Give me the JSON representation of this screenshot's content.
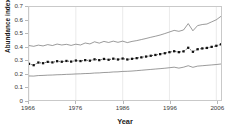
{
  "chart_data": {
    "type": "line",
    "title": "",
    "xlabel": "Year",
    "ylabel": "Abundance index",
    "xlim": [
      1966,
      2007
    ],
    "ylim": [
      0,
      0.7
    ],
    "grid": "vertical-light",
    "legend": "none",
    "xticks": [
      "1966",
      "1976",
      "1986",
      "1996",
      "2006"
    ],
    "xtick_values": [
      1966,
      1976,
      1986,
      1996,
      2006
    ],
    "yticks": [
      "0",
      "0.1",
      "0.2",
      "0.3",
      "0.4",
      "0.5",
      "0.6",
      "0.7"
    ],
    "ytick_values": [
      0,
      0.1,
      0.2,
      0.3,
      0.4,
      0.5,
      0.6,
      0.7
    ],
    "x": [
      1966,
      1967,
      1968,
      1969,
      1970,
      1971,
      1972,
      1973,
      1974,
      1975,
      1976,
      1977,
      1978,
      1979,
      1980,
      1981,
      1982,
      1983,
      1984,
      1985,
      1986,
      1987,
      1988,
      1989,
      1990,
      1991,
      1992,
      1993,
      1994,
      1995,
      1996,
      1997,
      1998,
      1999,
      2000,
      2001,
      2002,
      2003,
      2004,
      2005,
      2006,
      2007
    ],
    "series": [
      {
        "name": "upper confidence limit",
        "style": "solid-thin",
        "values": [
          0.41,
          0.404,
          0.413,
          0.407,
          0.417,
          0.41,
          0.421,
          0.414,
          0.419,
          0.411,
          0.42,
          0.414,
          0.429,
          0.422,
          0.438,
          0.428,
          0.441,
          0.433,
          0.443,
          0.434,
          0.443,
          0.432,
          0.441,
          0.447,
          0.455,
          0.463,
          0.472,
          0.48,
          0.489,
          0.5,
          0.512,
          0.524,
          0.517,
          0.527,
          0.575,
          0.521,
          0.56,
          0.568,
          0.572,
          0.588,
          0.604,
          0.63
        ]
      },
      {
        "name": "abundance index",
        "style": "dotted-markers",
        "values": [
          0.272,
          0.262,
          0.282,
          0.277,
          0.287,
          0.283,
          0.292,
          0.288,
          0.294,
          0.289,
          0.297,
          0.293,
          0.3,
          0.296,
          0.306,
          0.3,
          0.309,
          0.303,
          0.311,
          0.305,
          0.312,
          0.305,
          0.31,
          0.315,
          0.321,
          0.327,
          0.333,
          0.339,
          0.345,
          0.352,
          0.36,
          0.367,
          0.36,
          0.366,
          0.393,
          0.363,
          0.382,
          0.388,
          0.392,
          0.4,
          0.408,
          0.419
        ]
      },
      {
        "name": "lower confidence limit",
        "style": "solid-thin",
        "values": [
          0.181,
          0.18,
          0.184,
          0.185,
          0.187,
          0.188,
          0.19,
          0.191,
          0.193,
          0.194,
          0.196,
          0.197,
          0.199,
          0.2,
          0.203,
          0.204,
          0.207,
          0.208,
          0.211,
          0.212,
          0.215,
          0.216,
          0.218,
          0.221,
          0.224,
          0.227,
          0.23,
          0.233,
          0.236,
          0.239,
          0.243,
          0.247,
          0.24,
          0.247,
          0.258,
          0.246,
          0.255,
          0.258,
          0.261,
          0.264,
          0.267,
          0.271
        ]
      }
    ],
    "colors": {
      "line": "#555555",
      "marker": "#111111",
      "frame": "#c9c9c9",
      "grid": "#ececec",
      "text": "#1a1a1a"
    }
  }
}
